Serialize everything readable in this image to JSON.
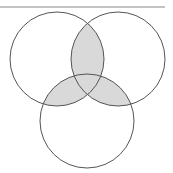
{
  "diagram": {
    "type": "venn-3",
    "top_rule": {
      "x1": 0,
      "x2": 165,
      "y": 7,
      "color": "#b0b0b0",
      "width": 1.5
    },
    "circles": [
      {
        "name": "A",
        "cx": 57,
        "cy": 59,
        "r": 47
      },
      {
        "name": "B",
        "cx": 118,
        "cy": 59,
        "r": 47
      },
      {
        "name": "C",
        "cx": 87,
        "cy": 121,
        "r": 47
      }
    ],
    "shaded_regions": [
      "A∩B",
      "A∩C",
      "B∩C"
    ],
    "colors": {
      "stroke": "#555555",
      "fill_shaded": "#d9d9d9",
      "background": "#ffffff"
    },
    "stroke_width": 1
  }
}
